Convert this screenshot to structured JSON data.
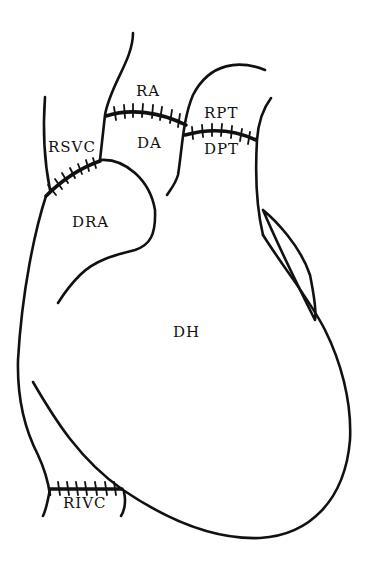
{
  "diagram": {
    "type": "anatomical line drawing",
    "background": "#ffffff",
    "line_color": "#111111",
    "labels": [
      {
        "id": "ra",
        "text": "RA",
        "x": 138,
        "y": 96
      },
      {
        "id": "rpt",
        "text": "RPT",
        "x": 204,
        "y": 118
      },
      {
        "id": "rsvc",
        "text": "RSVC",
        "x": 48,
        "y": 152
      },
      {
        "id": "da",
        "text": "DA",
        "x": 138,
        "y": 148
      },
      {
        "id": "dpt",
        "text": "DPT",
        "x": 204,
        "y": 154
      },
      {
        "id": "dra",
        "text": "DRA",
        "x": 72,
        "y": 227
      },
      {
        "id": "dh",
        "text": "DH",
        "x": 173,
        "y": 337
      },
      {
        "id": "rivc",
        "text": "RIVC",
        "x": 63,
        "y": 508
      }
    ]
  }
}
